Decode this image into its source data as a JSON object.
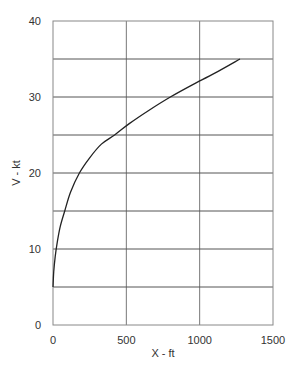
{
  "chart_data": {
    "type": "line",
    "title": "",
    "xlabel": "X - ft",
    "ylabel": "V - kt",
    "xlim": [
      0,
      1500
    ],
    "ylim": [
      0,
      40
    ],
    "x_ticks": [
      "0",
      "500",
      "1000",
      "1500"
    ],
    "y_ticks": [
      "0",
      "10",
      "20",
      "30",
      "40"
    ],
    "grid": true,
    "grid_x_step": 500,
    "grid_y_step": 5,
    "legend": null,
    "series": [
      {
        "name": "V vs X",
        "x": [
          0,
          5,
          15,
          30,
          50,
          80,
          120,
          180,
          250,
          330,
          420,
          520,
          650,
          800,
          950,
          1100,
          1275
        ],
        "y": [
          5,
          7,
          9,
          11,
          13,
          15,
          17.5,
          20,
          22,
          23.8,
          25,
          26.5,
          28.2,
          30,
          31.6,
          33.1,
          35
        ]
      }
    ]
  }
}
